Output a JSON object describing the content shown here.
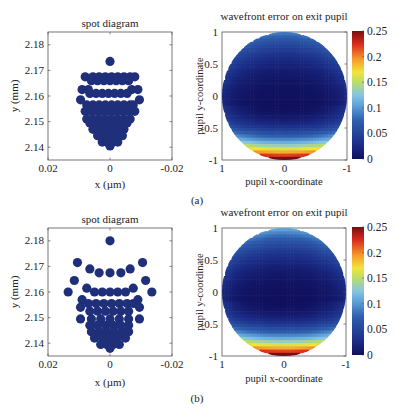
{
  "figure": {
    "panel_labels": [
      "(a)",
      "(b)"
    ]
  },
  "chart_data": [
    {
      "panel": "(a)",
      "type": "scatter",
      "title": "spot diagram",
      "xlabel": "x (µm)",
      "ylabel": "y (mm)",
      "xlim": [
        0.02,
        -0.02
      ],
      "ylim": [
        2.135,
        2.185
      ],
      "xticks": [
        0.02,
        0,
        -0.02
      ],
      "xtick_labels": [
        "0.02",
        "0",
        "-0.02"
      ],
      "yticks": [
        2.14,
        2.15,
        2.16,
        2.17,
        2.18
      ],
      "ytick_labels": [
        "2.14",
        "2.15",
        "2.16",
        "2.17",
        "2.18"
      ],
      "marker_color": "#1f2f7a",
      "rows": [
        {
          "y": 2.1735,
          "xs": [
            0
          ]
        },
        {
          "y": 2.1675,
          "xs": [
            0.008,
            0.0055,
            0.0035,
            0.0015,
            -0.0005,
            -0.0025,
            -0.0045,
            -0.0065,
            -0.008
          ]
        },
        {
          "y": 2.166,
          "xs": [
            0.006,
            0.004,
            0.002,
            0,
            -0.002,
            -0.004,
            -0.006
          ]
        },
        {
          "y": 2.1625,
          "xs": [
            0.009,
            0.007,
            -0.007,
            -0.009
          ]
        },
        {
          "y": 2.161,
          "xs": [
            0.0065,
            0.0045,
            0.0025,
            0.0005,
            -0.0015,
            -0.0035,
            -0.0055
          ]
        },
        {
          "y": 2.1585,
          "xs": [
            0.0095,
            -0.0095
          ]
        },
        {
          "y": 2.1565,
          "xs": [
            0.0075,
            0.0055,
            0.0035,
            0.0015,
            -0.0005,
            -0.0025,
            -0.0045,
            -0.0065,
            -0.0075
          ]
        },
        {
          "y": 2.154,
          "xs": [
            0.008,
            0.006,
            0.004,
            0.002,
            0,
            -0.002,
            -0.004,
            -0.006,
            -0.008
          ]
        },
        {
          "y": 2.151,
          "xs": [
            0.0075,
            0.0055,
            0.0035,
            0.0015,
            -0.0005,
            -0.0025,
            -0.0045,
            -0.0065
          ]
        },
        {
          "y": 2.1495,
          "xs": [
            0.0065,
            0.0045,
            0.0025,
            0.0005,
            -0.0015,
            -0.0035,
            -0.0055
          ]
        },
        {
          "y": 2.147,
          "xs": [
            0.0055,
            0.0035,
            0.0015,
            -0.0005,
            -0.0025,
            -0.0045
          ]
        },
        {
          "y": 2.1445,
          "xs": [
            0.004,
            0.002,
            0,
            -0.002,
            -0.004
          ]
        },
        {
          "y": 2.142,
          "xs": [
            0.0025,
            0.001,
            -0.001,
            -0.0025
          ]
        },
        {
          "y": 2.1405,
          "xs": [
            0
          ]
        }
      ]
    },
    {
      "panel": "(a)",
      "type": "heatmap",
      "title": "wavefront error on exit pupil",
      "xlabel": "pupil x-coordinate",
      "ylabel": "pupil y-coordinate",
      "xlim": [
        1,
        -1
      ],
      "ylim": [
        -1,
        1
      ],
      "xticks": [
        1,
        0,
        -1
      ],
      "xtick_labels": [
        "1",
        "0",
        "-1"
      ],
      "yticks": [
        1,
        0.5,
        0,
        -0.5,
        -1
      ],
      "ytick_labels": [
        "1",
        "0.5",
        "0",
        "-0.5",
        "-1"
      ],
      "colorbar": {
        "min": 0,
        "max": 0.25,
        "ticks": [
          0,
          0.05,
          0.1,
          0.15,
          0.2,
          0.25
        ],
        "tick_labels": [
          "0",
          "0.05",
          "0.1",
          "0.15",
          "0.2",
          "0.25"
        ],
        "colormap": "jet"
      },
      "description": "circular pupil; minimum (~0) near center slightly below, ~0.06 at top edge, rising to ~0.25 at bottom edge",
      "top_value": 0.07,
      "center_value": 0.0,
      "bottom_value": 0.25
    },
    {
      "panel": "(b)",
      "type": "scatter",
      "title": "spot diagram",
      "xlabel": "x (µm)",
      "ylabel": "y (mm)",
      "xlim": [
        0.02,
        -0.02
      ],
      "ylim": [
        2.135,
        2.185
      ],
      "xticks": [
        0.02,
        0,
        -0.02
      ],
      "xtick_labels": [
        "0.02",
        "0",
        "-0.02"
      ],
      "yticks": [
        2.14,
        2.15,
        2.16,
        2.17,
        2.18
      ],
      "ytick_labels": [
        "2.14",
        "2.15",
        "2.16",
        "2.17",
        "2.18"
      ],
      "marker_color": "#1f2f7a",
      "rows": [
        {
          "y": 2.18,
          "xs": [
            0
          ]
        },
        {
          "y": 2.1715,
          "xs": [
            0.0105,
            -0.0105
          ]
        },
        {
          "y": 2.169,
          "xs": [
            0.0065,
            -0.0065
          ]
        },
        {
          "y": 2.1675,
          "xs": [
            0.0035,
            0,
            -0.0035
          ]
        },
        {
          "y": 2.1645,
          "xs": [
            0.0115,
            -0.0115
          ]
        },
        {
          "y": 2.1615,
          "xs": [
            0.0075,
            -0.0075
          ]
        },
        {
          "y": 2.16,
          "xs": [
            0.0135,
            0.005,
            0.0025,
            0,
            -0.0025,
            -0.005,
            -0.0135
          ]
        },
        {
          "y": 2.157,
          "xs": [
            0.009,
            -0.009
          ]
        },
        {
          "y": 2.1555,
          "xs": [
            0.007,
            0.0045,
            0.002,
            -0.0005,
            -0.003,
            -0.0055,
            -0.0075
          ]
        },
        {
          "y": 2.154,
          "xs": [
            0.0095,
            -0.0095
          ]
        },
        {
          "y": 2.1525,
          "xs": [
            0.0065,
            0.004,
            0.0015,
            -0.001,
            -0.0035,
            -0.006
          ]
        },
        {
          "y": 2.1495,
          "xs": [
            0.0095,
            0.006,
            0.003,
            0,
            -0.003,
            -0.006,
            -0.0095
          ]
        },
        {
          "y": 2.147,
          "xs": [
            0.0065,
            0.004,
            0.0015,
            -0.001,
            -0.0035,
            -0.006
          ]
        },
        {
          "y": 2.1445,
          "xs": [
            0.006,
            0.0035,
            0.001,
            -0.0015,
            -0.004,
            -0.006
          ]
        },
        {
          "y": 2.142,
          "xs": [
            0.005,
            0.0025,
            0,
            -0.0025,
            -0.005
          ]
        },
        {
          "y": 2.1395,
          "xs": [
            0.003,
            0.001,
            -0.001,
            -0.003
          ]
        },
        {
          "y": 2.138,
          "xs": [
            0
          ]
        }
      ]
    },
    {
      "panel": "(b)",
      "type": "heatmap",
      "title": "wavefront error on exit pupil",
      "xlabel": "pupil x-coordinate",
      "ylabel": "pupil y-coordinate",
      "xlim": [
        1,
        -1
      ],
      "ylim": [
        -1,
        1
      ],
      "xticks": [
        1,
        0,
        -1
      ],
      "xtick_labels": [
        "1",
        "0",
        "-1"
      ],
      "yticks": [
        1,
        0.5,
        0,
        -0.5,
        -1
      ],
      "ytick_labels": [
        "1",
        "0.5",
        "0",
        "-0.5",
        "-1"
      ],
      "colorbar": {
        "min": 0,
        "max": 0.25,
        "ticks": [
          0,
          0.05,
          0.1,
          0.15,
          0.2,
          0.25
        ],
        "tick_labels": [
          "0",
          "0.05",
          "0.1",
          "0.15",
          "0.2",
          "0.25"
        ],
        "colormap": "jet"
      },
      "description": "circular pupil; minimum near center slightly below, ~0.09 at top edge, rising to ~0.25 at bottom edge",
      "top_value": 0.09,
      "center_value": 0.0,
      "bottom_value": 0.25
    }
  ]
}
